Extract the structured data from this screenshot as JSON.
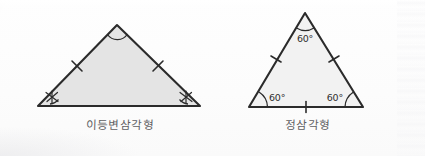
{
  "figure": {
    "title": "",
    "background_color": "#fdfdfd",
    "outline_color": "#2b2b2b"
  },
  "figures": [
    {
      "id": "isosceles-triangle",
      "caption": "이등변삼각형",
      "fill_color": "#e4e4e4",
      "vertices": {
        "apex": {
          "x": 117,
          "y": 25
        },
        "base_left": {
          "x": 38,
          "y": 106
        },
        "base_right": {
          "x": 200,
          "y": 106
        }
      },
      "angle_marks": [
        {
          "vertex": "apex",
          "type": "arc",
          "label": ""
        },
        {
          "vertex": "base_left",
          "type": "asterisk",
          "label": ""
        },
        {
          "vertex": "base_right",
          "type": "asterisk",
          "label": ""
        }
      ],
      "side_ticks": [
        {
          "side": "left",
          "count": 1
        },
        {
          "side": "right",
          "count": 1
        },
        {
          "side": "base",
          "count": 0
        }
      ]
    },
    {
      "id": "equilateral-triangle",
      "caption": "정삼각형",
      "fill_color": "#f2f2f2",
      "vertices": {
        "apex": {
          "x": 305,
          "y": 13
        },
        "base_left": {
          "x": 249,
          "y": 107
        },
        "base_right": {
          "x": 363,
          "y": 107
        }
      },
      "angle_marks": [
        {
          "vertex": "apex",
          "type": "arc",
          "label": "60°"
        },
        {
          "vertex": "base_left",
          "type": "arc",
          "label": "60°"
        },
        {
          "vertex": "base_right",
          "type": "arc",
          "label": "60°"
        }
      ],
      "side_ticks": [
        {
          "side": "left",
          "count": 1
        },
        {
          "side": "right",
          "count": 1
        },
        {
          "side": "base",
          "count": 1
        }
      ]
    }
  ],
  "labels": {
    "angle_apex_right": "60°",
    "angle_base_left_right": "60°",
    "angle_base_right_right": "60°"
  }
}
